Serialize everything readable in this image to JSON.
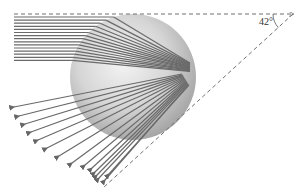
{
  "diagram": {
    "angle_label": "42°",
    "colors": {
      "ray": "#6a6a6a",
      "dashed": "#707070",
      "sphere_light": "#f2f2f2",
      "sphere_mid": "#cfcfcf",
      "sphere_dark": "#9a9a9a",
      "label": "#333333"
    },
    "sphere": {
      "cx": 133,
      "cy": 77,
      "r": 63
    },
    "focus": {
      "x": 190,
      "y": 66
    },
    "incoming_rays": {
      "count": 15,
      "x_start": 14,
      "y_start": 17,
      "y_step": 3.1
    },
    "outgoing_rays": {
      "count": 15
    },
    "reference_lines": {
      "horizontal": {
        "x1": 14,
        "y1": 14,
        "x2": 293,
        "y2": 14
      },
      "diagonal": {
        "x1": 293,
        "y1": 14,
        "x2": 103,
        "y2": 188
      }
    }
  }
}
